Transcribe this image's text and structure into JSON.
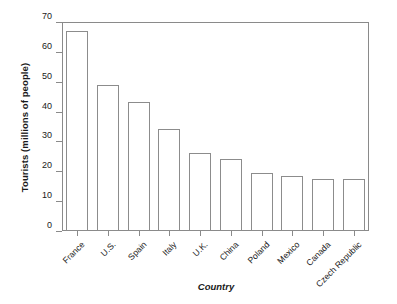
{
  "chart_data": {
    "type": "bar",
    "title": "",
    "xlabel": "Country",
    "ylabel": "Tourists (millions of people)",
    "categories": [
      "France",
      "U.S.",
      "Spain",
      "Italy",
      "U.K.",
      "China",
      "Poland",
      "Mexico",
      "Canada",
      "Czech Republic"
    ],
    "values": [
      67,
      49,
      43.3,
      34,
      26,
      24,
      19.5,
      18.5,
      17.5,
      17.3
    ],
    "ylim": [
      0,
      70
    ],
    "yticks": [
      0,
      10,
      20,
      30,
      40,
      50,
      60,
      70
    ],
    "ytick_labels": [
      "0",
      "10",
      "20",
      "30",
      "40",
      "50",
      "60",
      "70"
    ],
    "grid": false,
    "legend": false,
    "bar_fill_color": "#ffffff",
    "bar_edge_color": "#8c8c8c",
    "axis_color": "#8a8a8a",
    "text_color": "#1a1a1a",
    "background_color": "#ffffff",
    "xtick_label_rotation": -45
  }
}
